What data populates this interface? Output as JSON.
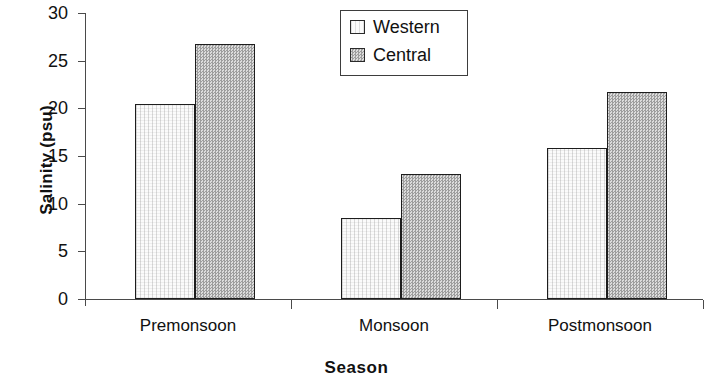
{
  "chart_data": {
    "type": "bar",
    "title": "",
    "xlabel": "Season",
    "ylabel": "Salinity (psu)",
    "categories": [
      "Premonsoon",
      "Monsoon",
      "Postmonsoon"
    ],
    "series": [
      {
        "name": "Western",
        "values": [
          20.5,
          8.5,
          15.8
        ],
        "swatch": "western"
      },
      {
        "name": "Central",
        "values": [
          26.7,
          13.1,
          21.7
        ],
        "swatch": "central"
      }
    ],
    "ylim": [
      0,
      30
    ],
    "yticks": [
      0,
      5,
      10,
      15,
      20,
      25,
      30
    ],
    "ytick_labels": [
      "0",
      "5",
      "10",
      "15",
      "20",
      "25",
      "30"
    ],
    "grid": false,
    "legend_position": "top-center",
    "colors": {
      "western_fill": "#fbfbfb",
      "central_fill": "#c2c2c2",
      "bar_outline": "#1d1d1d",
      "axis": "#4a4a4a",
      "text": "#111111"
    }
  },
  "legend": {
    "entries": [
      {
        "label": "Western"
      },
      {
        "label": "Central"
      }
    ]
  },
  "axes": {
    "y_title": "Salinity (psu)",
    "x_title": "Season"
  }
}
